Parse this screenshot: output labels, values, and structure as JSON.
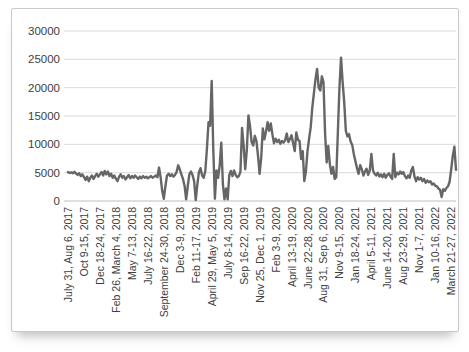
{
  "chart_data": {
    "type": "line",
    "title": "",
    "xlabel": "",
    "ylabel": "",
    "ylim": [
      0,
      30000
    ],
    "ytick_step": 5000,
    "y_tick_labels": [
      "0",
      "5000",
      "10000",
      "15000",
      "20000",
      "25000",
      "30000"
    ],
    "grid": "horizontal",
    "legend": "none",
    "tick_interval": 10,
    "x_tick_labels": [
      "July 31, Aug 6, 2017",
      "Oct 9-15, 2017",
      "Dec 18-24, 2017",
      "Feb 26, March 4, 2018",
      "May 7-13, 2018",
      "July 16-22, 2018",
      "September 24-30, 2018",
      "Dec 3-9, 2018",
      "Feb 11-17, 2019",
      "April 29, May 5, 2019",
      "July 8-14, 2019",
      "Sep 16-22, 2019",
      "Nov 25, Dec 1, 2019",
      "Feb 3-9, 2020",
      "April 13-19, 2020",
      "June 22-28, 2020",
      "Aug 31, Sep 6, 2020",
      "Nov 9-15, 2020",
      "Jan 18-24, 2021",
      "April 5-11, 2021",
      "June 14-20, 2021",
      "Aug 23-29, 2021",
      "Nov 1-7, 2021",
      "Jan 10-16, 2022",
      "March 21-27, 2022"
    ],
    "values": [
      5100,
      4950,
      5050,
      4900,
      5150,
      4850,
      4600,
      4900,
      4400,
      4700,
      4200,
      3700,
      4300,
      3500,
      4100,
      4500,
      3900,
      4400,
      4800,
      4300,
      4700,
      5100,
      4500,
      5300,
      4700,
      5200,
      4400,
      4800,
      4100,
      4500,
      3900,
      3500,
      4300,
      4700,
      4100,
      4400,
      3800,
      4200,
      4600,
      4000,
      4400,
      4100,
      4500,
      4200,
      3900,
      4300,
      4000,
      4400,
      4100,
      4300,
      4000,
      4200,
      4400,
      4100,
      4300,
      4500,
      4200,
      5900,
      4200,
      1800,
      400,
      2600,
      4500,
      4800,
      4400,
      4700,
      4300,
      4600,
      5100,
      6300,
      5600,
      4700,
      3900,
      2700,
      300,
      2600,
      4700,
      5200,
      4600,
      3500,
      150,
      2900,
      5100,
      5800,
      4500,
      4100,
      5300,
      9200,
      13900,
      13300,
      21200,
      9000,
      400,
      5400,
      4100,
      6300,
      10300,
      3000,
      300,
      2200,
      300,
      4600,
      5300,
      4400,
      5400,
      4600,
      4200,
      4400,
      5200,
      12900,
      9800,
      5600,
      9000,
      15100,
      13200,
      10400,
      9800,
      11500,
      10600,
      8000,
      4800,
      7600,
      12800,
      10900,
      12200,
      13900,
      12400,
      13700,
      11800,
      10200,
      11000,
      10400,
      10800,
      10100,
      10600,
      10300,
      10700,
      11900,
      10400,
      10900,
      11600,
      10200,
      8800,
      12100,
      10800,
      10600,
      7400,
      8800,
      3500,
      5200,
      8800,
      11000,
      13000,
      16500,
      19000,
      21500,
      23300,
      20000,
      19500,
      22000,
      21000,
      12000,
      6800,
      9700,
      6500,
      4800,
      6000,
      3900,
      4200,
      12000,
      20000,
      25300,
      21000,
      17400,
      12400,
      11400,
      11800,
      10500,
      9900,
      8300,
      7000,
      5800,
      4800,
      6300,
      5600,
      4500,
      5200,
      5700,
      4600,
      5400,
      8300,
      5400,
      4800,
      4500,
      5000,
      4300,
      4700,
      4200,
      4800,
      4100,
      4600,
      4900,
      4300,
      3900,
      8300,
      4200,
      5000,
      4700,
      5200,
      4800,
      5100,
      4400,
      4000,
      4500,
      4100,
      5400,
      6000,
      4300,
      3500,
      4200,
      3800,
      4100,
      3500,
      3900,
      3200,
      3600,
      3300,
      3500,
      2900,
      3100,
      2700,
      2600,
      2200,
      2000,
      700,
      2100,
      1800,
      2300,
      2600,
      3400,
      5600,
      8000,
      9600,
      5500
    ],
    "colors": {
      "line": "#666666",
      "gridline": "#d9d9d9",
      "axis_line": "#bfbfbf",
      "label_text": "#404040",
      "frame_border": "#c9c9c9",
      "background": "#ffffff"
    }
  }
}
